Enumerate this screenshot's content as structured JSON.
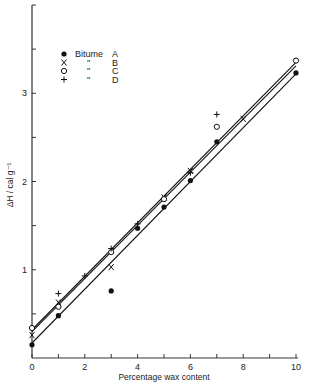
{
  "chart_data": {
    "type": "scatter",
    "title": "",
    "xlabel": "Percentage wax content",
    "ylabel": "ΔH / cal g⁻¹",
    "xlim": [
      0,
      10
    ],
    "ylim": [
      0,
      4
    ],
    "x_ticks": [
      0,
      1,
      2,
      3,
      4,
      5,
      6,
      7,
      8,
      9,
      10
    ],
    "x_tick_labels": [
      "0",
      "2",
      "4",
      "6",
      "8",
      "10"
    ],
    "x_tick_label_values": [
      0,
      2,
      4,
      6,
      8,
      10
    ],
    "y_ticks": [
      0.5,
      1,
      1.5,
      2,
      2.5,
      3,
      3.5
    ],
    "y_tick_labels": [
      "1",
      "2",
      "3"
    ],
    "y_tick_label_values": [
      1,
      2,
      3
    ],
    "grid": false,
    "legend_position": "upper left",
    "legend": [
      {
        "marker": "●",
        "label": "Bitume",
        "ditto": "",
        "sample": "A"
      },
      {
        "marker": "X",
        "label": "",
        "ditto": "\"",
        "sample": "B"
      },
      {
        "marker": "O",
        "label": "",
        "ditto": "\"",
        "sample": "C"
      },
      {
        "marker": "+",
        "label": "",
        "ditto": "\"",
        "sample": "D"
      }
    ],
    "series": [
      {
        "name": "Bitume A",
        "marker": "filled-circle",
        "x": [
          0,
          1,
          3,
          4,
          5,
          6,
          7,
          10
        ],
        "y": [
          0.15,
          0.48,
          0.76,
          1.47,
          1.71,
          2.01,
          2.45,
          3.23
        ]
      },
      {
        "name": "Bitume B",
        "marker": "x",
        "x": [
          0,
          1,
          3,
          5,
          6,
          8
        ],
        "y": [
          0.26,
          0.63,
          1.03,
          1.82,
          2.12,
          2.71
        ]
      },
      {
        "name": "Bitume C",
        "marker": "open-circle",
        "x": [
          0,
          1,
          3,
          5,
          7,
          10
        ],
        "y": [
          0.34,
          0.58,
          1.2,
          1.8,
          2.62,
          3.37
        ]
      },
      {
        "name": "Bitume D",
        "marker": "plus",
        "x": [
          1,
          2,
          3,
          4,
          6,
          7
        ],
        "y": [
          0.73,
          0.93,
          1.24,
          1.52,
          2.1,
          2.76
        ]
      }
    ],
    "fit_lines": [
      {
        "name": "upper fit",
        "x": [
          0,
          10
        ],
        "y": [
          0.32,
          3.35
        ]
      },
      {
        "name": "upper fit 2",
        "x": [
          0,
          10
        ],
        "y": [
          0.3,
          3.31
        ]
      },
      {
        "name": "lower fit",
        "x": [
          0,
          10
        ],
        "y": [
          0.17,
          3.22
        ]
      }
    ]
  }
}
